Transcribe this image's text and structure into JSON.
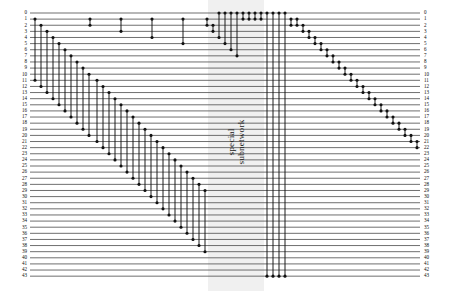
{
  "figure": {
    "kind": "quantum-circuit-diagram",
    "total_wires": 44,
    "wire_labels_left": [
      "0",
      "1",
      "2",
      "3",
      "4",
      "5",
      "6",
      "7",
      "8",
      "9",
      "10",
      "11",
      "12",
      "13",
      "14",
      "15",
      "16",
      "17",
      "18",
      "19",
      "20",
      "21",
      "22",
      "23",
      "24",
      "25",
      "26",
      "27",
      "28",
      "29",
      "30",
      "31",
      "32",
      "33",
      "34",
      "35",
      "36",
      "37",
      "38",
      "39",
      "40",
      "41",
      "42",
      "43"
    ],
    "wire_labels_right": [
      "0",
      "1",
      "2",
      "3",
      "4",
      "5",
      "6",
      "7",
      "8",
      "9",
      "10",
      "11",
      "12",
      "13",
      "14",
      "15",
      "16",
      "17",
      "18",
      "19",
      "20",
      "21",
      "22",
      "23",
      "24",
      "25",
      "26",
      "27",
      "28",
      "29",
      "30",
      "31",
      "32",
      "33",
      "34",
      "35",
      "36",
      "37",
      "38",
      "39",
      "40",
      "41",
      "42",
      "43"
    ],
    "highlight_band": {
      "label_line1": "special",
      "label_line2": "subnetwork",
      "x": 208,
      "width": 56,
      "fill": "#f0f0f0"
    },
    "colors": {
      "wire": "#555555",
      "gate_line": "#111111",
      "dot": "#111111",
      "label": "#111111",
      "background": "#ffffff"
    },
    "geometry": {
      "wire_x_start": 30,
      "wire_x_end": 420,
      "wire_y_top": 13,
      "wire_y_step": 6.12,
      "dot_radius": 1.55,
      "wire_width": 0.85,
      "gate_width": 0.95
    },
    "gates": [
      {
        "x": 35,
        "a": 1,
        "b": 11
      },
      {
        "x": 41,
        "a": 2,
        "b": 12
      },
      {
        "x": 47,
        "a": 3,
        "b": 13
      },
      {
        "x": 53,
        "a": 4,
        "b": 14
      },
      {
        "x": 59,
        "a": 5,
        "b": 15
      },
      {
        "x": 65,
        "a": 6,
        "b": 16
      },
      {
        "x": 71,
        "a": 7,
        "b": 17
      },
      {
        "x": 77,
        "a": 8,
        "b": 18
      },
      {
        "x": 83,
        "a": 9,
        "b": 19
      },
      {
        "x": 89,
        "a": 10,
        "b": 20
      },
      {
        "x": 97,
        "a": 11,
        "b": 21
      },
      {
        "x": 103,
        "a": 12,
        "b": 22
      },
      {
        "x": 109,
        "a": 13,
        "b": 23
      },
      {
        "x": 115,
        "a": 14,
        "b": 24
      },
      {
        "x": 121,
        "a": 15,
        "b": 25
      },
      {
        "x": 127,
        "a": 16,
        "b": 26
      },
      {
        "x": 133,
        "a": 17,
        "b": 27
      },
      {
        "x": 139,
        "a": 18,
        "b": 28
      },
      {
        "x": 145,
        "a": 19,
        "b": 29
      },
      {
        "x": 151,
        "a": 20,
        "b": 30
      },
      {
        "x": 157,
        "a": 21,
        "b": 31
      },
      {
        "x": 163,
        "a": 22,
        "b": 32
      },
      {
        "x": 169,
        "a": 23,
        "b": 33
      },
      {
        "x": 175,
        "a": 24,
        "b": 34
      },
      {
        "x": 181,
        "a": 25,
        "b": 35
      },
      {
        "x": 187,
        "a": 26,
        "b": 36
      },
      {
        "x": 193,
        "a": 27,
        "b": 37
      },
      {
        "x": 199,
        "a": 28,
        "b": 38
      },
      {
        "x": 205,
        "a": 29,
        "b": 39
      },
      {
        "x": 90,
        "a": 1,
        "b": 2
      },
      {
        "x": 121,
        "a": 1,
        "b": 3
      },
      {
        "x": 152,
        "a": 1,
        "b": 4
      },
      {
        "x": 183,
        "a": 1,
        "b": 5
      },
      {
        "x": 207,
        "a": 1,
        "b": 2
      },
      {
        "x": 213,
        "a": 2,
        "b": 3
      },
      {
        "x": 219,
        "a": 0,
        "b": 4
      },
      {
        "x": 225,
        "a": 0,
        "b": 5
      },
      {
        "x": 231,
        "a": 0,
        "b": 6
      },
      {
        "x": 237,
        "a": 0,
        "b": 7
      },
      {
        "x": 243,
        "a": 0,
        "b": 1
      },
      {
        "x": 249,
        "a": 0,
        "b": 1
      },
      {
        "x": 255,
        "a": 0,
        "b": 1
      },
      {
        "x": 261,
        "a": 0,
        "b": 1
      },
      {
        "x": 267,
        "a": 0,
        "b": 43
      },
      {
        "x": 273,
        "a": 0,
        "b": 43
      },
      {
        "x": 279,
        "a": 0,
        "b": 43
      },
      {
        "x": 285,
        "a": 0,
        "b": 43
      },
      {
        "x": 291,
        "a": 1,
        "b": 2
      },
      {
        "x": 297,
        "a": 1,
        "b": 2
      },
      {
        "x": 303,
        "a": 2,
        "b": 3
      },
      {
        "x": 309,
        "a": 3,
        "b": 4
      },
      {
        "x": 315,
        "a": 4,
        "b": 5
      },
      {
        "x": 321,
        "a": 5,
        "b": 6
      },
      {
        "x": 327,
        "a": 6,
        "b": 7
      },
      {
        "x": 333,
        "a": 7,
        "b": 8
      },
      {
        "x": 339,
        "a": 8,
        "b": 9
      },
      {
        "x": 345,
        "a": 9,
        "b": 10
      },
      {
        "x": 351,
        "a": 10,
        "b": 11
      },
      {
        "x": 357,
        "a": 11,
        "b": 12
      },
      {
        "x": 363,
        "a": 12,
        "b": 13
      },
      {
        "x": 369,
        "a": 13,
        "b": 14
      },
      {
        "x": 375,
        "a": 14,
        "b": 15
      },
      {
        "x": 381,
        "a": 15,
        "b": 16
      },
      {
        "x": 387,
        "a": 16,
        "b": 17
      },
      {
        "x": 393,
        "a": 17,
        "b": 18
      },
      {
        "x": 399,
        "a": 18,
        "b": 19
      },
      {
        "x": 405,
        "a": 19,
        "b": 20
      },
      {
        "x": 411,
        "a": 20,
        "b": 21
      },
      {
        "x": 417,
        "a": 21,
        "b": 22
      }
    ]
  }
}
